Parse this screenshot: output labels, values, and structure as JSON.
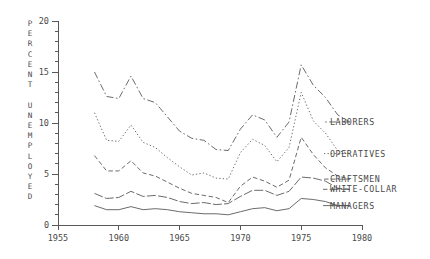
{
  "chart_data": {
    "type": "line",
    "title": "",
    "xlabel": "",
    "ylabel": "PERCENT UNEMPLOYED",
    "xlim": [
      1955,
      1980
    ],
    "ylim": [
      0,
      20
    ],
    "grid": false,
    "legend_position": "right-inline-labels",
    "x_major_ticks": [
      1955,
      1960,
      1965,
      1970,
      1975,
      1980
    ],
    "x_tick_labels": [
      "1955",
      "1960",
      "1965",
      "1970",
      "1975",
      "1980"
    ],
    "y_major_ticks": [
      0,
      5,
      10,
      15,
      20
    ],
    "y_tick_labels": [
      "0",
      "5",
      "10",
      "15",
      "20"
    ],
    "y_minor_tick_step": 1,
    "ylabel_chars": [
      "P",
      "E",
      "R",
      "C",
      "E",
      "N",
      "T",
      "",
      "U",
      "N",
      "E",
      "M",
      "P",
      "L",
      "O",
      "Y",
      "E",
      "D"
    ],
    "x": [
      1958,
      1959,
      1960,
      1961,
      1962,
      1963,
      1964,
      1965,
      1966,
      1967,
      1968,
      1969,
      1970,
      1971,
      1972,
      1973,
      1974,
      1975,
      1976,
      1977,
      1978,
      1979
    ],
    "series": [
      {
        "name": "LABORERS",
        "label": "LABORERS",
        "linestyle": "dash-dot",
        "dasharray": "7,2.5,1.6,2.5",
        "values": [
          15.0,
          12.6,
          12.4,
          14.6,
          12.4,
          12.0,
          10.6,
          9.2,
          8.5,
          8.3,
          7.4,
          7.3,
          9.4,
          10.8,
          10.3,
          8.6,
          10.1,
          15.7,
          13.7,
          12.5,
          10.8,
          10.1
        ]
      },
      {
        "name": "OPERATIVES",
        "label": "OPERATIVES",
        "linestyle": "dotted",
        "dasharray": "1.3,2.2",
        "values": [
          11.0,
          8.3,
          8.2,
          9.8,
          8.1,
          7.6,
          6.6,
          5.7,
          4.9,
          5.1,
          4.6,
          4.5,
          7.1,
          8.4,
          7.8,
          6.2,
          7.6,
          13.0,
          10.2,
          9.0,
          7.3,
          7.0
        ]
      },
      {
        "name": "CRAFTSMEN",
        "label": "CRAFTSMEN",
        "linestyle": "dashed",
        "dasharray": "4.5,2.6",
        "values": [
          6.8,
          5.3,
          5.3,
          6.3,
          5.1,
          4.8,
          4.2,
          3.6,
          3.1,
          2.9,
          2.7,
          2.2,
          3.8,
          4.7,
          4.3,
          3.7,
          4.4,
          8.6,
          6.9,
          5.6,
          4.8,
          4.5
        ]
      },
      {
        "name": "WHITE-COLLAR",
        "label": "WHITE-COLLAR",
        "linestyle": "long-dash",
        "dasharray": "9,2.2",
        "values": [
          3.1,
          2.6,
          2.7,
          3.3,
          2.8,
          2.9,
          2.7,
          2.3,
          2.1,
          2.2,
          2.0,
          2.1,
          2.8,
          3.4,
          3.4,
          2.9,
          3.3,
          4.7,
          4.6,
          4.3,
          3.6,
          3.5
        ]
      },
      {
        "name": "MANAGERS",
        "label": "MANAGERS",
        "linestyle": "solid",
        "dasharray": "0",
        "values": [
          1.9,
          1.5,
          1.5,
          1.8,
          1.5,
          1.6,
          1.5,
          1.3,
          1.2,
          1.1,
          1.1,
          1.0,
          1.3,
          1.6,
          1.7,
          1.4,
          1.6,
          2.6,
          2.5,
          2.3,
          1.9,
          1.9
        ]
      }
    ],
    "series_label_positions": [
      {
        "name": "LABORERS",
        "y_value": 10.1
      },
      {
        "name": "OPERATIVES",
        "y_value": 7.0
      },
      {
        "name": "CRAFTSMEN",
        "y_value": 4.5
      },
      {
        "name": "WHITE-COLLAR",
        "y_value": 3.5
      },
      {
        "name": "MANAGERS",
        "y_value": 1.9
      }
    ],
    "colors": {
      "line": "#5a5a5a",
      "axis": "#585858",
      "text": "#4a4a4a",
      "background": "#ffffff"
    }
  }
}
